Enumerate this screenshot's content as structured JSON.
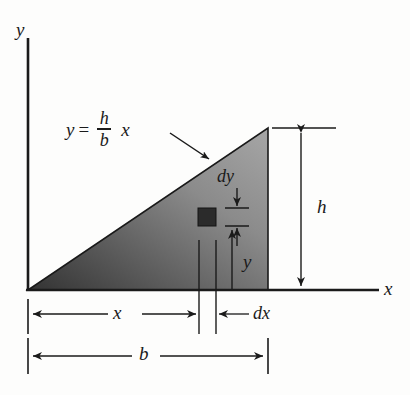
{
  "figure": {
    "axes": {
      "y_label": "y",
      "x_label": "x"
    },
    "equation": {
      "lhs": "y",
      "equals": "=",
      "numerator": "h",
      "denominator": "b",
      "variable": "x",
      "full_text": "y = h/b x"
    },
    "dimensions": {
      "height_label": "h",
      "base_label": "b",
      "x_label": "x",
      "dx_label": "dx",
      "dy_label": "dy",
      "y_label": "y"
    },
    "colors": {
      "ink": "#1a1a1a",
      "background": "#fdfdfc",
      "fill_light": "#9a9a9a",
      "fill_mid": "#6a6a6a",
      "fill_dark": "#363636",
      "element_fill": "#2b2b2b"
    },
    "geometry": {
      "origin_x": 28,
      "origin_y": 290,
      "apex_x": 268,
      "apex_y": 128,
      "base_width": 240,
      "height": 162,
      "element_x": 198,
      "element_y": 208,
      "element_size": 18
    }
  }
}
